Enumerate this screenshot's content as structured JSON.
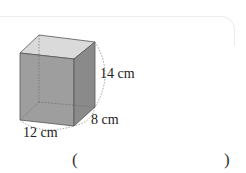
{
  "figure": {
    "shape": "rectangular-prism",
    "labels": {
      "height": "14 cm",
      "depth": "8 cm",
      "width": "12 cm"
    },
    "colors": {
      "top_face": "#dadada",
      "front_face": "#9e9e9e",
      "side_face": "#8a8a8a",
      "edge": "#555555",
      "hidden_edge": "#777777"
    }
  },
  "answer": {
    "open_paren": "(",
    "close_paren": ")",
    "value": ""
  }
}
